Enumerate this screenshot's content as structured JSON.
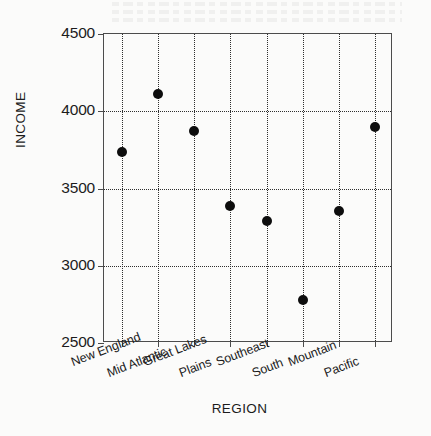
{
  "chart_data": {
    "type": "scatter",
    "title": "",
    "xlabel": "REGION",
    "ylabel": "INCOME",
    "categories": [
      "New England",
      "Mid Atlantic",
      "Great Lakes",
      "Plains",
      "Southeast",
      "South",
      "Mountain",
      "Pacific"
    ],
    "values": [
      3737,
      4112,
      3875,
      3388,
      3289,
      2776,
      3355,
      3901
    ],
    "ylim": [
      2500,
      4500
    ],
    "yticks": [
      2500,
      3000,
      3500,
      4000,
      4500
    ],
    "ytick_labels": [
      "2500",
      "3000",
      "3500",
      "4000",
      "4500"
    ],
    "grid": "dotted-both",
    "legend": "none",
    "marker": "filled-circle",
    "marker_color": "#0d0d0d"
  },
  "axes": {
    "y_title": "INCOME",
    "x_title": "REGION"
  },
  "colors": {
    "frame": "#4c4c4c",
    "grid": "#2e2e2e",
    "marker": "#0d0d0d",
    "text": "#1c1c1c",
    "background": "#fbfbfa"
  }
}
